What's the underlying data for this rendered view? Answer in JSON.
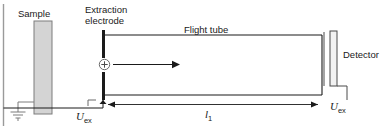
{
  "figure": {
    "width": 388,
    "height": 130,
    "background": "#ffffff",
    "line_color": "#1a1a1a",
    "sample_fill": "#d4d4d4",
    "detector_fill": "#f2f2f2"
  },
  "labels": {
    "sample": "Sample",
    "extraction_electrode": "Extraction\nelectrode",
    "flight_tube": "Flight tube",
    "detector": "Detector"
  },
  "variables": {
    "u_extraction_left": {
      "symbol": "U",
      "subscript": "ex"
    },
    "flight_length": {
      "symbol": "l",
      "subscript": "1"
    },
    "u_extraction_right": {
      "symbol": "U",
      "subscript": "ex"
    }
  },
  "components": {
    "ion": {
      "charge": "+",
      "name": "positive-ion"
    },
    "ground": {
      "name": "earth-ground-symbol"
    },
    "ion_direction_arrow": {
      "name": "ion-flight-direction"
    },
    "length_dimension_arrow": {
      "name": "flight-length-dimension"
    }
  }
}
